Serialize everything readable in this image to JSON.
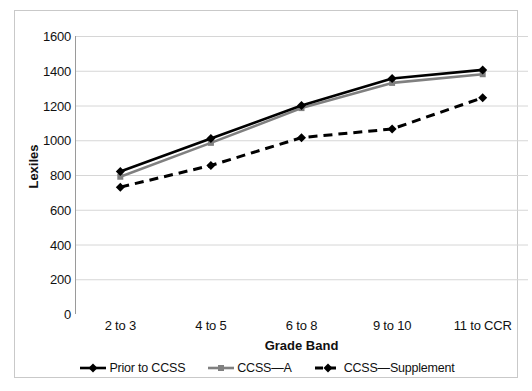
{
  "chart_data": {
    "type": "line",
    "title": "",
    "xlabel": "Grade Band",
    "ylabel": "Lexiles",
    "categories": [
      "2 to 3",
      "4 to 5",
      "6 to 8",
      "9 to 10",
      "11 to CCR"
    ],
    "ylim": [
      0,
      1600
    ],
    "y_ticks": [
      0,
      200,
      400,
      600,
      800,
      1000,
      1200,
      1400,
      1600
    ],
    "y_tick_labels": [
      "0",
      "200",
      "400",
      "600",
      "800",
      "1000",
      "1200",
      "1400",
      "1600"
    ],
    "grid": true,
    "legend_position": "bottom",
    "series": [
      {
        "name": "Prior to CCSS",
        "values": [
          820,
          1010,
          1200,
          1355,
          1405
        ],
        "color": "#000000",
        "style": "solid",
        "marker": "diamond"
      },
      {
        "name": "CCSS—A",
        "values": [
          790,
          985,
          1185,
          1330,
          1380
        ],
        "color": "#808080",
        "style": "solid",
        "marker": "square"
      },
      {
        "name": "CCSS—Supplement",
        "values": [
          730,
          855,
          1015,
          1065,
          1245
        ],
        "color": "#000000",
        "style": "dashed",
        "marker": "diamond"
      }
    ]
  },
  "legend": {
    "items": [
      {
        "label": "Prior to CCSS"
      },
      {
        "label": "CCSS—A"
      },
      {
        "label": "CCSS—Supplement"
      }
    ]
  }
}
